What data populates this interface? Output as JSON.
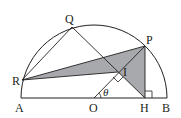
{
  "figure": {
    "labels": {
      "A": "A",
      "B": "B",
      "O": "O",
      "H": "H",
      "P": "P",
      "Q": "Q",
      "R": "R",
      "I": "I",
      "angle": "θ"
    },
    "colors": {
      "stroke": "#231f20",
      "shade": "#a7a9ac"
    }
  }
}
